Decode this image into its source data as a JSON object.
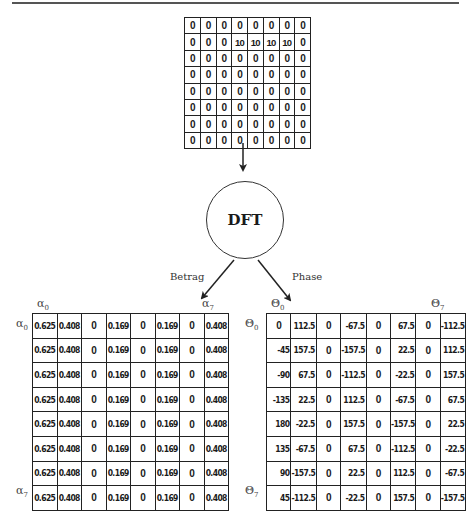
{
  "input": {
    "rows": [
      [
        "0",
        "0",
        "0",
        "0",
        "0",
        "0",
        "0",
        "0"
      ],
      [
        "0",
        "0",
        "0",
        "10",
        "10",
        "10",
        "10",
        "0"
      ],
      [
        "0",
        "0",
        "0",
        "0",
        "0",
        "0",
        "0",
        "0"
      ],
      [
        "0",
        "0",
        "0",
        "0",
        "0",
        "0",
        "0",
        "0"
      ],
      [
        "0",
        "0",
        "0",
        "0",
        "0",
        "0",
        "0",
        "0"
      ],
      [
        "0",
        "0",
        "0",
        "0",
        "0",
        "0",
        "0",
        "0"
      ],
      [
        "0",
        "0",
        "0",
        "0",
        "0",
        "0",
        "0",
        "0"
      ],
      [
        "0",
        "0",
        "0",
        "0",
        "0",
        "0",
        "0",
        "0"
      ]
    ]
  },
  "transform": {
    "label": "DFT"
  },
  "branches": {
    "magnitude_label": "Betrag",
    "phase_label": "Phase"
  },
  "magnitude": {
    "col_first_label": "α",
    "col_first_sub": "0",
    "col_last_label": "α",
    "col_last_sub": "7",
    "row_first_label": "α",
    "row_first_sub": "0",
    "row_last_label": "α",
    "row_last_sub": "7",
    "rows": [
      [
        "0.625",
        "0.408",
        "0",
        "0.169",
        "0",
        "0.169",
        "0",
        "0.408"
      ],
      [
        "0.625",
        "0.408",
        "0",
        "0.169",
        "0",
        "0.169",
        "0",
        "0.408"
      ],
      [
        "0.625",
        "0.408",
        "0",
        "0.169",
        "0",
        "0.169",
        "0",
        "0.408"
      ],
      [
        "0.625",
        "0.408",
        "0",
        "0.169",
        "0",
        "0.169",
        "0",
        "0.408"
      ],
      [
        "0.625",
        "0.408",
        "0",
        "0.169",
        "0",
        "0.169",
        "0",
        "0.408"
      ],
      [
        "0.625",
        "0.408",
        "0",
        "0.169",
        "0",
        "0.169",
        "0",
        "0.408"
      ],
      [
        "0.625",
        "0.408",
        "0",
        "0.169",
        "0",
        "0.169",
        "0",
        "0.408"
      ],
      [
        "0.625",
        "0.408",
        "0",
        "0.169",
        "0",
        "0.169",
        "0",
        "0.408"
      ]
    ]
  },
  "phase": {
    "col_first_label": "Θ",
    "col_first_sub": "0",
    "col_last_label": "Θ",
    "col_last_sub": "7",
    "row_first_label": "Θ",
    "row_first_sub": "0",
    "row_last_label": "Θ",
    "row_last_sub": "7",
    "rows": [
      [
        "0",
        "112.5",
        "0",
        "-67.5",
        "0",
        "67.5",
        "0",
        "-112.5"
      ],
      [
        "-45",
        "157.5",
        "0",
        "-157.5",
        "0",
        "22.5",
        "0",
        "112.5"
      ],
      [
        "-90",
        "67.5",
        "0",
        "-112.5",
        "0",
        "-22.5",
        "0",
        "157.5"
      ],
      [
        "-135",
        "22.5",
        "0",
        "112.5",
        "0",
        "-67.5",
        "0",
        "67.5"
      ],
      [
        "180",
        "-22.5",
        "0",
        "157.5",
        "0",
        "-157.5",
        "0",
        "22.5"
      ],
      [
        "135",
        "-67.5",
        "0",
        "67.5",
        "0",
        "-112.5",
        "0",
        "-22.5"
      ],
      [
        "90",
        "-157.5",
        "0",
        "22.5",
        "0",
        "112.5",
        "0",
        "-67.5"
      ],
      [
        "45",
        "-112.5",
        "0",
        "-22.5",
        "0",
        "157.5",
        "0",
        "-157.5"
      ]
    ]
  },
  "colors": {
    "line": "#222222",
    "text": "#1a1a1a",
    "background": "#ffffff"
  }
}
